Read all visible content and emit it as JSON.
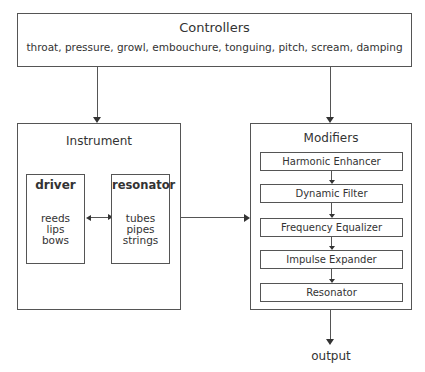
{
  "controllers": {
    "title": "Controllers",
    "items": "throat, pressure, growl, embouchure, tonguing, pitch, scream, damping"
  },
  "instrument": {
    "title": "Instrument",
    "driver": {
      "title": "driver",
      "items": [
        "reeds",
        "lips",
        "bows"
      ]
    },
    "resonator": {
      "title": "resonator",
      "items": [
        "tubes",
        "pipes",
        "strings"
      ]
    }
  },
  "modifiers": {
    "title": "Modifiers",
    "stages": [
      "Harmonic Enhancer",
      "Dynamic Filter",
      "Frequency Equalizer",
      "Impulse Expander",
      "Resonator"
    ]
  },
  "output": {
    "label": "output"
  },
  "colors": {
    "line": "#555555",
    "text": "#333333",
    "background": "#ffffff"
  }
}
